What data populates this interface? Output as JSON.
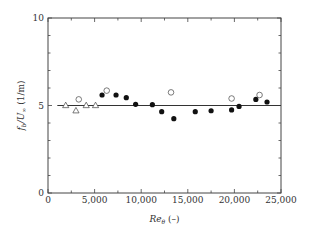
{
  "chart_data": {
    "type": "scatter",
    "title": "",
    "xlabel": "Re_θ (–)",
    "ylabel": "f_b/U_∞ (1/m)",
    "xlim": [
      0,
      25000
    ],
    "ylim": [
      0,
      10
    ],
    "grid": false,
    "x_ticks": [
      0,
      5000,
      10000,
      15000,
      20000,
      25000
    ],
    "x_tick_labels": [
      "0",
      "5,000",
      "10,000",
      "15,000",
      "20,000",
      "25,000"
    ],
    "y_ticks": [
      0,
      5,
      10
    ],
    "y_tick_labels": [
      "0",
      "5",
      "10"
    ],
    "reference_line": {
      "y": 5,
      "x_start": 1000,
      "x_end": 25000
    },
    "series": [
      {
        "name": "triangles",
        "marker": "open-triangle",
        "x": [
          1900,
          3000,
          4100,
          5100
        ],
        "y": [
          5.0,
          4.7,
          5.0,
          5.0
        ]
      },
      {
        "name": "open-circles",
        "marker": "open-circle",
        "x": [
          3300,
          6300,
          13200,
          19700,
          22700
        ],
        "y": [
          5.35,
          5.85,
          5.75,
          5.4,
          5.6
        ]
      },
      {
        "name": "filled-circles",
        "marker": "filled-circle",
        "x": [
          5800,
          7300,
          8400,
          9400,
          11200,
          12200,
          13500,
          15800,
          17500,
          19700,
          20500,
          22300,
          23500
        ],
        "y": [
          5.6,
          5.6,
          5.45,
          5.07,
          5.05,
          4.65,
          4.25,
          4.65,
          4.7,
          4.75,
          4.95,
          5.35,
          5.2
        ]
      }
    ]
  }
}
